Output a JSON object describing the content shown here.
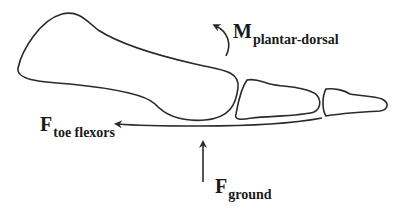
{
  "diagram": {
    "type": "biomechanics-toe-diagram",
    "stroke_color": "#2a2a2a",
    "labels": {
      "moment": {
        "main": "M",
        "sub": "plantar-dorsal"
      },
      "toe_flexors": {
        "main": "F",
        "sub": "toe flexors"
      },
      "ground": {
        "main": "F",
        "sub": "ground"
      }
    },
    "elements": [
      {
        "name": "metatarsal-bone",
        "kind": "outline"
      },
      {
        "name": "proximal-phalanx",
        "kind": "outline"
      },
      {
        "name": "distal-phalanx",
        "kind": "outline"
      },
      {
        "name": "moment-arrow",
        "kind": "curved-arrow",
        "direction": "counter-clockwise"
      },
      {
        "name": "toe-flexor-force-arrow",
        "kind": "arrow",
        "direction": "left"
      },
      {
        "name": "ground-force-arrow",
        "kind": "arrow",
        "direction": "up"
      }
    ]
  }
}
